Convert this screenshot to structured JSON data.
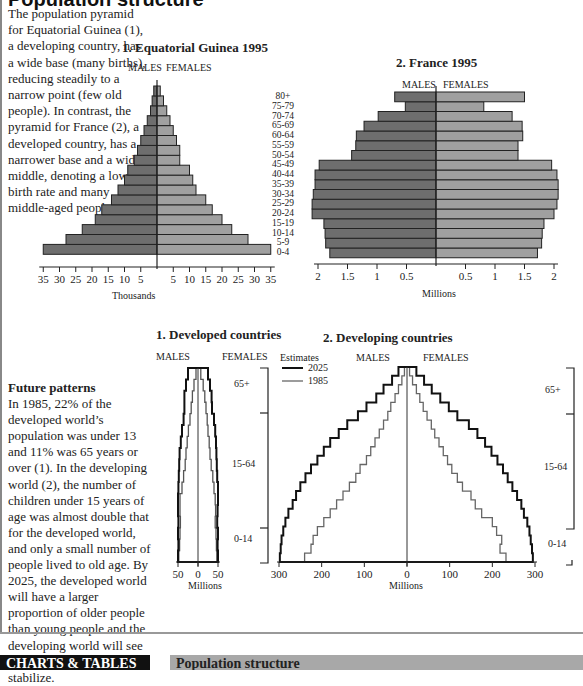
{
  "page": {
    "title": "Population structure",
    "intro_text": "The population pyramid for Equatorial Guinea (1), a developing country, has a wide base (many births), reducing steadily to a narrow point (few old people). In contrast, the pyramid for France (2), a developed country, has a narrower base and a wide middle, denoting a low birth rate and many middle-aged people.",
    "future_heading": "Future patterns",
    "future_text": "In 1985, 22% of the developed world’s population was under 13 and 11% was 65 years or over (1). In the developing world (2), the number of children under 15 years of age was almost double that for the developed world, and only a small number of people lived to old age. By 2025, the developed world will have a larger proportion of older people than young people and the developing world will see population numbers stabilize.",
    "footer": {
      "category": "CHARTS & TABLES",
      "section": "Population structure"
    }
  },
  "labels": {
    "males": "MALES",
    "females": "FEMALES",
    "thousands": "Thousands",
    "millions": "Millions",
    "estimates": "Estimates",
    "y2025": "2025",
    "y1985": "1985",
    "band_65": "65+",
    "band_15_64": "15-64",
    "band_0_14": "0-14"
  },
  "chart_data": [
    {
      "type": "bar",
      "subtype": "population-pyramid",
      "title": "1. Equatorial Guinea 1995",
      "xlabel": "Thousands",
      "categories": [
        "0-4",
        "5-9",
        "10-14",
        "15-19",
        "20-24",
        "25-29",
        "30-34",
        "35-39",
        "40-44",
        "45-49",
        "50-54",
        "55-59",
        "60-64",
        "65-69",
        "70-74",
        "75-79",
        "80+"
      ],
      "series": [
        {
          "name": "MALES",
          "values": [
            35,
            28,
            23,
            19,
            17,
            14,
            12,
            10,
            9,
            7,
            6,
            5,
            4,
            3,
            2,
            1.5,
            1
          ]
        },
        {
          "name": "FEMALES",
          "values": [
            35,
            28,
            23,
            20,
            17,
            15,
            12,
            11,
            10,
            7,
            7,
            6,
            5,
            4,
            3,
            2,
            1
          ]
        }
      ],
      "xticks": [
        35,
        30,
        25,
        20,
        15,
        10,
        5,
        5,
        10,
        15,
        20,
        25,
        30,
        35
      ],
      "xlim": [
        -35,
        35
      ]
    },
    {
      "type": "bar",
      "subtype": "population-pyramid",
      "title": "2. France 1995",
      "xlabel": "Millions",
      "categories": [
        "0-4",
        "5-9",
        "10-14",
        "15-19",
        "20-24",
        "25-29",
        "30-34",
        "35-39",
        "40-44",
        "45-49",
        "50-54",
        "55-59",
        "60-64",
        "65-69",
        "70-74",
        "75-79",
        "80+"
      ],
      "series": [
        {
          "name": "MALES",
          "values": [
            1.8,
            1.87,
            1.88,
            1.9,
            2.1,
            2.1,
            2.08,
            2.05,
            2.05,
            1.98,
            1.43,
            1.36,
            1.35,
            1.22,
            0.98,
            0.52,
            0.7
          ]
        },
        {
          "name": "FEMALES",
          "values": [
            1.72,
            1.79,
            1.8,
            1.83,
            2.0,
            2.05,
            2.07,
            2.07,
            2.05,
            1.96,
            1.39,
            1.39,
            1.47,
            1.46,
            1.29,
            0.81,
            1.5
          ]
        }
      ],
      "xticks": [
        2,
        1.5,
        1,
        0.5,
        0.5,
        1,
        1.5,
        2
      ],
      "xlim": [
        -2,
        2
      ]
    },
    {
      "type": "line",
      "subtype": "step-pyramid",
      "title": "1. Developed countries",
      "xlabel": "Millions",
      "xticks": [
        50,
        0,
        50
      ],
      "bands": [
        "0-14",
        "15-64",
        "65+"
      ],
      "series": [
        {
          "name": "2025",
          "males_max": 50,
          "females_max": 50,
          "shape": "near-rectangular, wide top"
        },
        {
          "name": "1985",
          "males_max": 48,
          "females_max": 48,
          "shape": "narrowing toward top"
        }
      ]
    },
    {
      "type": "line",
      "subtype": "step-pyramid",
      "title": "2. Developing countries",
      "xlabel": "Millions",
      "xticks": [
        300,
        200,
        100,
        0,
        100,
        200,
        300
      ],
      "xlim": [
        -300,
        300
      ],
      "legend": {
        "title": "Estimates",
        "entries": [
          "2025",
          "1985"
        ]
      },
      "bands": [
        "0-14",
        "15-64",
        "65+"
      ],
      "series": [
        {
          "name": "2025",
          "males_base": 298,
          "females_base": 295
        },
        {
          "name": "1985",
          "males_base": 240,
          "females_base": 232
        }
      ]
    }
  ]
}
